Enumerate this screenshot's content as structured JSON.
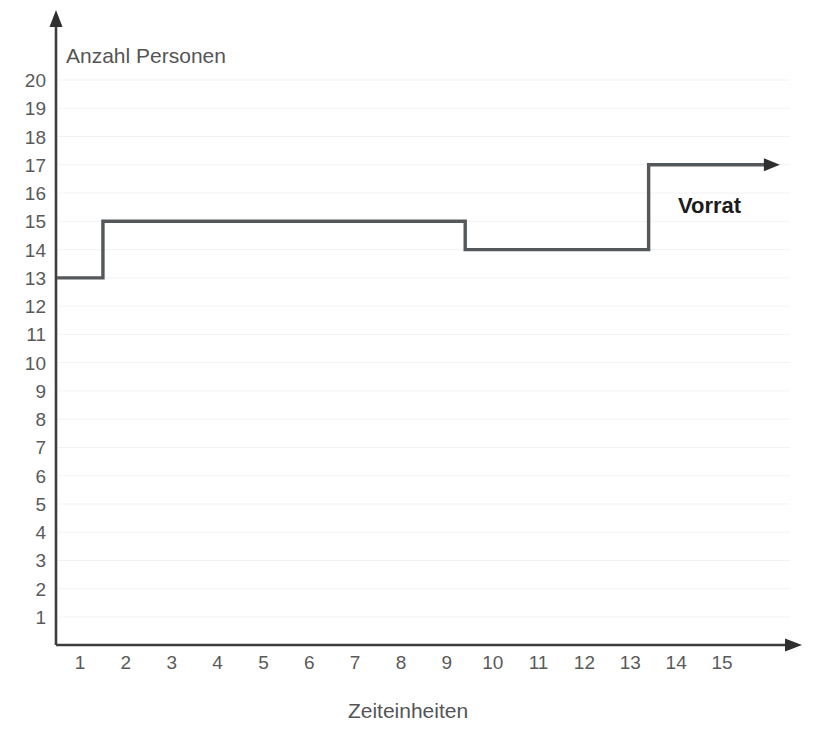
{
  "chart_data": {
    "type": "line",
    "subtype": "step",
    "title": "",
    "xlabel": "Zeiteinheiten",
    "ylabel": "Anzahl Personen",
    "xlim": [
      0,
      16
    ],
    "ylim": [
      0,
      21
    ],
    "grid": true,
    "legend_position": "inline-right",
    "x_ticks": [
      1,
      2,
      3,
      4,
      5,
      6,
      7,
      8,
      9,
      10,
      11,
      12,
      13,
      14,
      15
    ],
    "y_ticks": [
      1,
      2,
      3,
      4,
      5,
      6,
      7,
      8,
      9,
      10,
      11,
      12,
      13,
      14,
      15,
      16,
      17,
      18,
      19,
      20
    ],
    "series": [
      {
        "name": "Vorrat",
        "color": "#54585a",
        "step_segments": [
          {
            "x_start": 0.5,
            "x_end": 1.5,
            "value": 13
          },
          {
            "x_start": 1.5,
            "x_end": 9.4,
            "value": 15
          },
          {
            "x_start": 9.4,
            "x_end": 13.4,
            "value": 14
          },
          {
            "x_start": 13.4,
            "x_end": 16.0,
            "value": 17
          }
        ],
        "values": [
          13,
          15,
          15,
          15,
          15,
          15,
          15,
          15,
          15,
          14,
          14,
          14,
          14,
          17,
          17
        ],
        "annotation": "Vorrat",
        "ends_with_arrow": true
      }
    ]
  },
  "axes": {
    "y_axis_title": "Anzahl Personen",
    "x_axis_title": "Zeiteinheiten",
    "y_axis_has_arrow": true,
    "x_axis_has_arrow": true,
    "axis_color": "#3d3d3d",
    "tick_label_color": "#5a5a5a"
  },
  "annotations": {
    "vorrat_label": "Vorrat"
  }
}
